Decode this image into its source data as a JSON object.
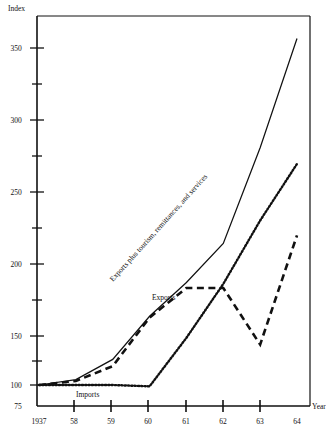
{
  "chart_data": {
    "type": "line",
    "title": "",
    "xlabel": "Year",
    "ylabel": "Index",
    "x": [
      1957,
      1958,
      1959,
      1960,
      1961,
      1962,
      1963,
      1964
    ],
    "xtick_labels": [
      "1937",
      "58",
      "59",
      "60",
      "61",
      "62",
      "63",
      "64"
    ],
    "ytick_labels": [
      "75",
      "100",
      "150",
      "200",
      "250",
      "300",
      "350"
    ],
    "ytick_values": [
      75,
      100,
      150,
      200,
      250,
      300,
      350
    ],
    "ylim": [
      75,
      375
    ],
    "grid": false,
    "legend_position": "inline-annotations",
    "series": [
      {
        "name": "Exports plus tourism, remittances, and services",
        "style": "solid",
        "color": "#111111",
        "values": [
          100,
          104,
          119,
          151,
          176,
          205,
          276,
          357
        ]
      },
      {
        "name": "Exports",
        "style": "dashed",
        "color": "#111111",
        "values": [
          100,
          103,
          114,
          150,
          172,
          172,
          130,
          211
        ]
      },
      {
        "name": "Imports",
        "style": "dotted",
        "color": "#111111",
        "values": [
          100,
          100,
          100,
          99,
          135,
          175,
          222,
          264
        ]
      }
    ],
    "annotations": [
      {
        "text": "Exports plus tourism, remittances, and services",
        "rotation": -48
      },
      {
        "text": "Exports",
        "rotation": 0
      },
      {
        "text": "Imports",
        "rotation": 0
      }
    ]
  }
}
